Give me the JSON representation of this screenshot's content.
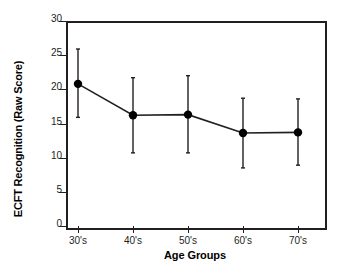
{
  "chart_data": {
    "type": "line",
    "title": "",
    "xlabel": "Age Groups",
    "ylabel": "ECFT Recognition (Raw Score)",
    "categories": [
      "30's",
      "40's",
      "50's",
      "60's",
      "70's"
    ],
    "values": [
      20.8,
      16.2,
      16.3,
      13.6,
      13.7
    ],
    "error_low": [
      15.9,
      10.7,
      10.7,
      8.5,
      8.9
    ],
    "error_high": [
      25.9,
      21.7,
      22.0,
      18.7,
      18.6
    ],
    "series": [
      {
        "name": "ECFT Recognition",
        "values": [
          20.8,
          16.2,
          16.3,
          13.6,
          13.7
        ]
      }
    ],
    "ylim": [
      0,
      30
    ],
    "yticks": [
      0,
      5,
      10,
      15,
      20,
      25,
      30
    ],
    "ytick_labels": [
      "0",
      "5",
      "10",
      "15",
      "20",
      "25",
      "30"
    ],
    "xtick_labels": [
      "30's",
      "40's",
      "50's",
      "60's",
      "70's"
    ],
    "grid": false,
    "legend": false,
    "legend_position": "none",
    "marker": "filled-circle",
    "error_bars": "vertical-capped",
    "line_color": "#231f20",
    "marker_color": "#000000",
    "frame": true
  },
  "axes": {
    "y_title": "ECFT Recognition (Raw Score)",
    "x_title": "Age Groups"
  }
}
